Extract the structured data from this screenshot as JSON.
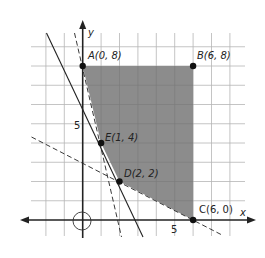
{
  "diagram": {
    "type": "feasible-region-graph",
    "axes": {
      "x_label": "x",
      "y_label": "y",
      "x_tick_label": "5",
      "y_tick_label": "5",
      "origin_marker": "circle"
    },
    "grid": {
      "x_min": -2,
      "x_max": 8,
      "y_min": -1,
      "y_max": 9,
      "step": 1
    },
    "points": [
      {
        "id": "A",
        "label": "A(0, 8)",
        "x": 0,
        "y": 8
      },
      {
        "id": "B",
        "label": "B(6, 8)",
        "x": 6,
        "y": 8
      },
      {
        "id": "C",
        "label": "C(6, 0)",
        "x": 6,
        "y": 0
      },
      {
        "id": "D",
        "label": "D(2, 2)",
        "x": 2,
        "y": 2
      },
      {
        "id": "E",
        "label": "E(1, 4)",
        "x": 1,
        "y": 4
      }
    ],
    "region": {
      "vertices": [
        "A",
        "B",
        "C",
        "D",
        "E"
      ],
      "fill": "#8c8c8c"
    },
    "lines": [
      {
        "equation": "4x + y = 8",
        "style": "dashed"
      },
      {
        "equation": "2x + y = 6",
        "style": "solid"
      },
      {
        "equation": "x + 2y = 6",
        "style": "dashed"
      }
    ]
  }
}
